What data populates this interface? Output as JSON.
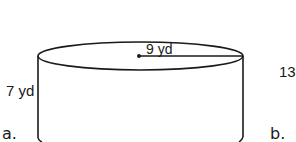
{
  "figure_a": {
    "label": "a.",
    "shape": "cylinder",
    "radius_label": "9 yd",
    "height_label": "7 yd",
    "radius": 9,
    "height": 7,
    "unit": "yd"
  },
  "figure_b": {
    "label": "b.",
    "partial_value": "13"
  },
  "colors": {
    "stroke": "#1a1a1a",
    "background": "#ffffff"
  }
}
